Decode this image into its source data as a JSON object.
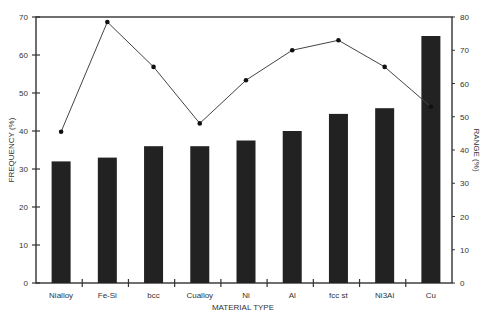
{
  "chart_data": {
    "type": "bar+line",
    "title": "",
    "xlabel": "MATERIAL TYPE",
    "ylabel": "FREQUENCY (%)",
    "ylabel_right": "RANGE (%)",
    "categories": [
      "Nialloy",
      "Fe-Si",
      "bcc",
      "Cualloy",
      "Ni",
      "Al",
      "fcc st",
      "Ni3Al",
      "Cu"
    ],
    "series": [
      {
        "name": "FREQUENCY (%)",
        "type": "bar",
        "axis": "left",
        "values": [
          32,
          33,
          36,
          36,
          37.5,
          40,
          44.5,
          46,
          65
        ]
      },
      {
        "name": "RANGE (%)",
        "type": "line",
        "axis": "right",
        "values": [
          45.5,
          78.5,
          65,
          48,
          61,
          70,
          73,
          65,
          53
        ]
      }
    ],
    "ylim": [
      0,
      70
    ],
    "ylim_right": [
      0,
      80
    ],
    "yticks": [
      0,
      10,
      20,
      30,
      40,
      50,
      60,
      70
    ],
    "yticks_right": [
      0,
      10,
      20,
      30,
      40,
      50,
      60,
      70,
      80
    ],
    "grid": false,
    "legend": "none",
    "colors": {
      "bar": "#222222",
      "line": "#444444",
      "marker": "#111111",
      "axis": "#333333"
    }
  }
}
